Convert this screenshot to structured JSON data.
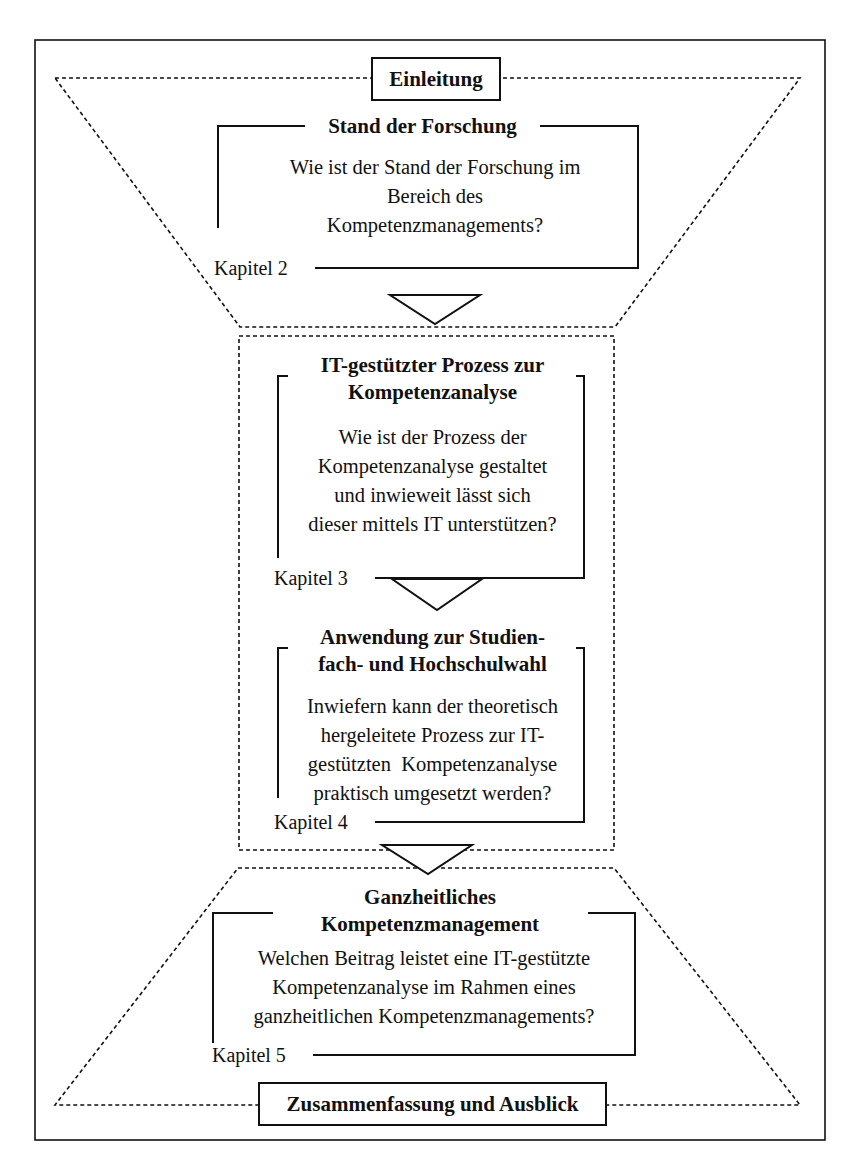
{
  "diagram": {
    "intro_label": "Einleitung",
    "outro_label": "Zusammenfassung und Ausblick",
    "sections": [
      {
        "title_lines": [
          "Stand der Forschung"
        ],
        "question_lines": [
          "Wie ist der Stand der Forschung im",
          "Bereich des",
          "Kompetenzmanagements?"
        ],
        "chapter": "Kapitel 2"
      },
      {
        "title_lines": [
          "IT-gestützter Prozess zur",
          "Kompetenzanalyse"
        ],
        "question_lines": [
          "Wie ist der Prozess der",
          "Kompetenzanalyse gestaltet",
          "und inwieweit lässt sich",
          "dieser mittels IT unterstützen?"
        ],
        "chapter": "Kapitel 3"
      },
      {
        "title_lines": [
          "Anwendung zur Studien-",
          "fach- und Hochschulwahl"
        ],
        "question_lines": [
          "Inwiefern kann der theoretisch",
          "hergeleitete Prozess zur IT-",
          "gestützten  Kompetenzanalyse",
          "praktisch umgesetzt werden?"
        ],
        "chapter": "Kapitel 4"
      },
      {
        "title_lines": [
          "Ganzheitliches",
          "Kompetenzmanagement"
        ],
        "question_lines": [
          "Welchen Beitrag leistet eine IT-gestützte",
          "Kompetenzanalyse im Rahmen eines",
          "ganzheitlichen Kompetenzmanagements?"
        ],
        "chapter": "Kapitel 5"
      }
    ]
  }
}
